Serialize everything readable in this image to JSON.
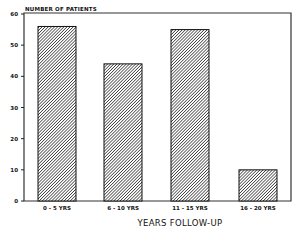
{
  "chart_data": {
    "type": "bar",
    "title": "",
    "ylabel": "NUMBER OF PATIENTS",
    "xlabel": "YEARS FOLLOW-UP",
    "categories": [
      "0 - 5 YRS",
      "6 - 10 YRS",
      "11 - 15 YRS",
      "16 - 20 YRS"
    ],
    "values": [
      56,
      44,
      55,
      10
    ],
    "ylim": [
      0,
      60
    ],
    "yticks": [
      0,
      10,
      20,
      30,
      40,
      50,
      60
    ],
    "grid": false,
    "legend": null,
    "bar_fill": "diagonal-hatch",
    "colors": {
      "bar_fill": "#8a8a8a",
      "outline": "#111111",
      "background": "#ffffff"
    }
  }
}
